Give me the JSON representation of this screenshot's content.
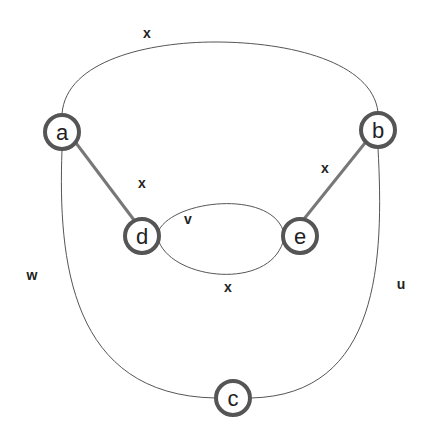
{
  "diagram": {
    "type": "graph",
    "nodes": [
      {
        "id": "a",
        "label": "a",
        "x": 62,
        "y": 132
      },
      {
        "id": "b",
        "label": "b",
        "x": 378,
        "y": 130
      },
      {
        "id": "c",
        "label": "c",
        "x": 233,
        "y": 398
      },
      {
        "id": "d",
        "label": "d",
        "x": 142,
        "y": 236
      },
      {
        "id": "e",
        "label": "e",
        "x": 300,
        "y": 236
      }
    ],
    "edges": [
      {
        "from": "a",
        "to": "b",
        "label": "x",
        "style": "thin-curve-top"
      },
      {
        "from": "a",
        "to": "d",
        "label": "x",
        "style": "thick"
      },
      {
        "from": "b",
        "to": "e",
        "label": "x",
        "style": "thick"
      },
      {
        "from": "d",
        "to": "e",
        "label": "v",
        "style": "thin-upper-arc"
      },
      {
        "from": "d",
        "to": "e",
        "label": "x",
        "style": "thin-lower-arc"
      },
      {
        "from": "a",
        "to": "c",
        "label": "w",
        "style": "thin-curve-left"
      },
      {
        "from": "b",
        "to": "c",
        "label": "u",
        "style": "thin-curve-right"
      }
    ],
    "labels": {
      "top_edge": "x",
      "ad_edge": "x",
      "be_edge": "x",
      "de_upper": "v",
      "de_lower": "x",
      "left_edge": "w",
      "right_edge": "u"
    }
  }
}
